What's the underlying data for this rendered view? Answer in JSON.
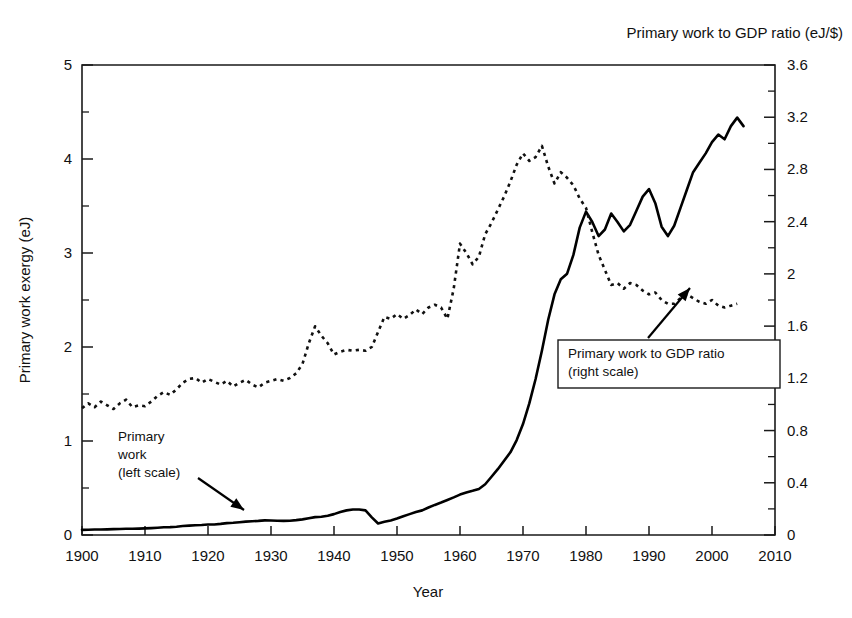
{
  "chart_data": {
    "type": "line",
    "title": "",
    "corner_title": "Primary work to GDP ratio (eJ/$)",
    "xlabel": "Year",
    "ylabel": "Primary work exergy (eJ)",
    "ylabel_right": "",
    "grid": false,
    "xlim": [
      1900,
      2010
    ],
    "ylim": [
      0,
      5
    ],
    "ylim_right": [
      0,
      3.6
    ],
    "xticks": [
      1900,
      1910,
      1920,
      1930,
      1940,
      1950,
      1960,
      1970,
      1980,
      1990,
      2000,
      2010
    ],
    "xtick_labels": [
      "1900",
      "1910",
      "1920",
      "1930",
      "1940",
      "1950",
      "1960",
      "1970",
      "1980",
      "1990",
      "2000",
      "2010"
    ],
    "yticks": [
      0,
      1,
      2,
      3,
      4,
      5
    ],
    "ytick_labels": [
      "0",
      "1",
      "2",
      "3",
      "4",
      "5"
    ],
    "yticks_minor": [
      0.5,
      1.5,
      2.5,
      3.5,
      4.5
    ],
    "yticks_right": [
      0,
      0.4,
      0.8,
      1.2,
      1.6,
      2,
      2.4,
      2.8,
      3.2,
      3.6
    ],
    "ytick_labels_right": [
      "0",
      "0.4",
      "0.8",
      "1.2",
      "1.6",
      "2",
      "2.4",
      "2.8",
      "3.2",
      "3.6"
    ],
    "yticks_right_minor": [
      0.2,
      0.6,
      1.0,
      1.4,
      1.8,
      2.2,
      2.6,
      3.0,
      3.4
    ],
    "legend_position": "inline-annotations",
    "series": [
      {
        "name": "Primary work",
        "axis": "left",
        "style": "solid",
        "color": "#000000",
        "unit": "eJ",
        "x": [
          1900,
          1901,
          1902,
          1903,
          1904,
          1905,
          1906,
          1907,
          1908,
          1909,
          1910,
          1911,
          1912,
          1913,
          1914,
          1915,
          1916,
          1917,
          1918,
          1919,
          1920,
          1921,
          1922,
          1923,
          1924,
          1925,
          1926,
          1927,
          1928,
          1929,
          1930,
          1931,
          1932,
          1933,
          1934,
          1935,
          1936,
          1937,
          1938,
          1939,
          1940,
          1941,
          1942,
          1943,
          1944,
          1945,
          1946,
          1947,
          1948,
          1949,
          1950,
          1951,
          1952,
          1953,
          1954,
          1955,
          1956,
          1957,
          1958,
          1959,
          1960,
          1961,
          1962,
          1963,
          1964,
          1965,
          1966,
          1967,
          1968,
          1969,
          1970,
          1971,
          1972,
          1973,
          1974,
          1975,
          1976,
          1977,
          1978,
          1979,
          1980,
          1981,
          1982,
          1983,
          1984,
          1985,
          1986,
          1987,
          1988,
          1989,
          1990,
          1991,
          1992,
          1993,
          1994,
          1995,
          1996,
          1997,
          1998,
          1999,
          2000,
          2001,
          2002,
          2003,
          2004,
          2005
        ],
        "y": [
          0.055,
          0.056,
          0.058,
          0.059,
          0.06,
          0.062,
          0.064,
          0.066,
          0.066,
          0.068,
          0.07,
          0.073,
          0.077,
          0.082,
          0.084,
          0.088,
          0.095,
          0.1,
          0.104,
          0.106,
          0.112,
          0.112,
          0.118,
          0.126,
          0.13,
          0.136,
          0.142,
          0.146,
          0.15,
          0.156,
          0.154,
          0.152,
          0.15,
          0.152,
          0.158,
          0.166,
          0.178,
          0.19,
          0.194,
          0.205,
          0.222,
          0.245,
          0.262,
          0.272,
          0.272,
          0.262,
          0.188,
          0.122,
          0.14,
          0.155,
          0.175,
          0.2,
          0.222,
          0.245,
          0.262,
          0.292,
          0.32,
          0.345,
          0.372,
          0.4,
          0.43,
          0.452,
          0.47,
          0.49,
          0.54,
          0.62,
          0.7,
          0.79,
          0.88,
          1.01,
          1.18,
          1.4,
          1.66,
          1.96,
          2.29,
          2.56,
          2.72,
          2.78,
          2.98,
          3.27,
          3.44,
          3.33,
          3.18,
          3.25,
          3.42,
          3.33,
          3.23,
          3.3,
          3.45,
          3.6,
          3.68,
          3.53,
          3.28,
          3.18,
          3.29,
          3.48,
          3.67,
          3.86,
          3.96,
          4.06,
          4.18,
          4.26,
          4.21,
          4.35,
          4.44,
          4.35
        ]
      },
      {
        "name": "Primary work to GDP ratio",
        "axis": "right",
        "style": "dotted",
        "color": "#111111",
        "unit": "eJ/$",
        "x": [
          1900,
          1901,
          1902,
          1903,
          1904,
          1905,
          1906,
          1907,
          1908,
          1909,
          1910,
          1911,
          1912,
          1913,
          1914,
          1915,
          1916,
          1917,
          1918,
          1919,
          1920,
          1921,
          1922,
          1923,
          1924,
          1925,
          1926,
          1927,
          1928,
          1929,
          1930,
          1931,
          1932,
          1933,
          1934,
          1935,
          1936,
          1937,
          1938,
          1939,
          1940,
          1941,
          1942,
          1943,
          1944,
          1945,
          1946,
          1947,
          1948,
          1949,
          1950,
          1951,
          1952,
          1953,
          1954,
          1955,
          1956,
          1957,
          1958,
          1959,
          1960,
          1961,
          1962,
          1963,
          1964,
          1965,
          1966,
          1967,
          1968,
          1969,
          1970,
          1971,
          1972,
          1973,
          1974,
          1975,
          1976,
          1977,
          1978,
          1979,
          1980,
          1981,
          1982,
          1983,
          1984,
          1985,
          1986,
          1987,
          1988,
          1989,
          1990,
          1991,
          1992,
          1993,
          1994,
          1995,
          1996,
          1997,
          1998,
          1999,
          2000,
          2001,
          2002,
          2003,
          2004
        ],
        "y_left_scale": [
          1.35,
          1.4,
          1.36,
          1.42,
          1.38,
          1.34,
          1.4,
          1.44,
          1.36,
          1.38,
          1.37,
          1.42,
          1.48,
          1.52,
          1.49,
          1.55,
          1.62,
          1.66,
          1.67,
          1.62,
          1.66,
          1.63,
          1.6,
          1.64,
          1.58,
          1.62,
          1.65,
          1.6,
          1.57,
          1.62,
          1.64,
          1.66,
          1.64,
          1.67,
          1.72,
          1.82,
          2.04,
          2.22,
          2.12,
          2.04,
          1.92,
          1.95,
          1.97,
          1.96,
          1.97,
          1.96,
          2.0,
          2.16,
          2.32,
          2.3,
          2.35,
          2.3,
          2.34,
          2.4,
          2.35,
          2.42,
          2.45,
          2.42,
          2.3,
          2.62,
          3.1,
          3.0,
          2.88,
          2.96,
          3.2,
          3.32,
          3.46,
          3.6,
          3.76,
          3.94,
          4.06,
          3.98,
          4.02,
          4.14,
          3.92,
          3.74,
          3.86,
          3.8,
          3.72,
          3.58,
          3.48,
          3.22,
          2.98,
          2.82,
          2.66,
          2.68,
          2.62,
          2.68,
          2.66,
          2.6,
          2.56,
          2.58,
          2.5,
          2.46,
          2.46,
          2.52,
          2.56,
          2.52,
          2.48,
          2.46,
          2.5,
          2.44,
          2.42,
          2.44,
          2.46
        ]
      }
    ],
    "annotations": [
      {
        "id": "primary-work-annotation",
        "lines": [
          "Primary",
          "work",
          "(left scale)"
        ],
        "boxed": false,
        "text_x": 118,
        "text_y": 441,
        "arrow": {
          "x1": 198,
          "y1": 478,
          "x2": 244,
          "y2": 510
        }
      },
      {
        "id": "gdp-ratio-annotation",
        "lines": [
          "Primary work to GDP ratio",
          "(right scale)"
        ],
        "boxed": true,
        "box": {
          "x": 558,
          "y": 340,
          "width": 222,
          "height": 48
        },
        "text_x": 568,
        "text_y": 358,
        "arrow": {
          "x1": 648,
          "y1": 338,
          "x2": 690,
          "y2": 288
        }
      }
    ]
  },
  "plot_geometry": {
    "left": 82,
    "right": 775,
    "top": 65,
    "bottom": 535
  }
}
